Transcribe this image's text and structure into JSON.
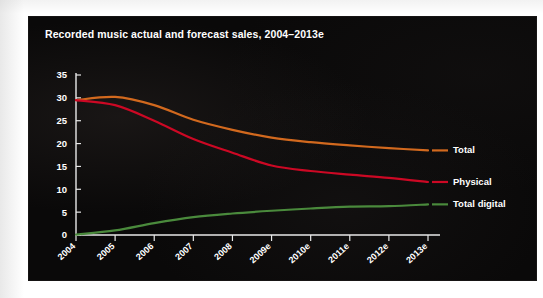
{
  "chart_panel": {
    "background_color": "#0a0909",
    "title": "Recorded music actual and forecast sales, 2004–2013e"
  },
  "chart_data": {
    "type": "line",
    "title": "Recorded music actual and forecast sales, 2004–2013e",
    "subtitle": "",
    "xlabel": "",
    "ylabel": "",
    "x": [
      "2004",
      "2005",
      "2006",
      "2007",
      "2008",
      "2009e",
      "2010e",
      "2011e",
      "2012e",
      "2013e"
    ],
    "categories": [
      "2004",
      "2005",
      "2006",
      "2007",
      "2008",
      "2009e",
      "2010e",
      "2011e",
      "2012e",
      "2013e"
    ],
    "xtick_labels": [
      "2004",
      "2005",
      "2006",
      "2007",
      "2008",
      "2009e",
      "2010e",
      "2011e",
      "2012e",
      "2013e"
    ],
    "ytick_labels": [
      "0",
      "5",
      "10",
      "15",
      "20",
      "25",
      "30",
      "35"
    ],
    "yticks": [
      0,
      5,
      10,
      15,
      20,
      25,
      30,
      35
    ],
    "ylim": [
      0,
      35
    ],
    "grid": false,
    "legend_position": "right-inline",
    "series": [
      {
        "name": "Total",
        "color": "#d2691e",
        "values": [
          29.5,
          30.2,
          28.4,
          25.2,
          23.0,
          21.3,
          20.3,
          19.6,
          19.0,
          18.5
        ]
      },
      {
        "name": "Physical",
        "color": "#cc0824",
        "values": [
          29.5,
          28.4,
          25.0,
          21.0,
          18.0,
          15.2,
          14.0,
          13.2,
          12.5,
          11.6
        ]
      },
      {
        "name": "Total digital",
        "color": "#4a8a3c",
        "values": [
          0.1,
          1.0,
          2.6,
          3.9,
          4.7,
          5.3,
          5.8,
          6.2,
          6.3,
          6.7
        ]
      }
    ],
    "legend_entries": [
      {
        "label": "Total",
        "color": "#d2691e"
      },
      {
        "label": "Physical",
        "color": "#cc0824"
      },
      {
        "label": "Total digital",
        "color": "#4a8a3c"
      }
    ],
    "axis_color": "#e8e8e8",
    "text_color": "#ffffff"
  }
}
